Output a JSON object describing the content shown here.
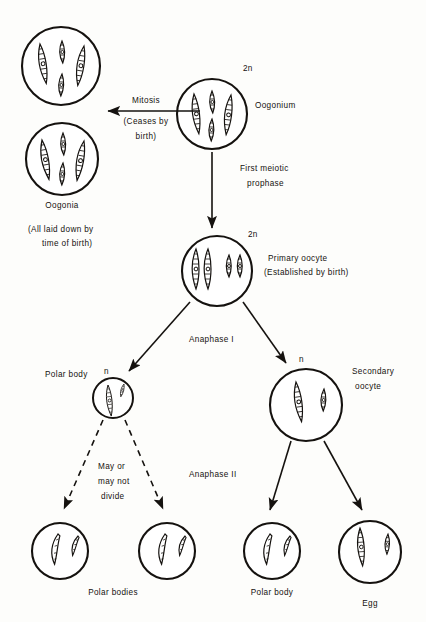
{
  "diagram": {
    "background_color": "#fdfdfb",
    "ink_color": "#15120f",
    "labels": {
      "mitosis": "Mitosis",
      "ceases_by_birth_line1": "(Ceases by",
      "ceases_by_birth_line2": "birth)",
      "oogonia": "Oogonia",
      "all_laid_down_line1": "(All laid down by",
      "all_laid_down_line2": "time of birth)",
      "oogonium": "Oogonium",
      "ploidy_2n_oogonium": "2n",
      "first_meiotic_line1": "First meiotic",
      "first_meiotic_line2": "prophase",
      "ploidy_2n_primary_oocyte": "2n",
      "primary_oocyte_line1": "Primary oocyte",
      "primary_oocyte_line2": "(Established by birth)",
      "anaphase_i": "Anaphase I",
      "polar_body": "Polar body",
      "ploidy_n_polar_body": "n",
      "ploidy_n_secondary_oocyte": "n",
      "secondary_oocyte_line1": "Secondary",
      "secondary_oocyte_line2": "oocyte",
      "may_or_line1": "May or",
      "may_or_line2": "may not",
      "may_or_line3": "divide",
      "anaphase_ii": "Anaphase II",
      "polar_bodies": "Polar bodies",
      "polar_body_bottom": "Polar body",
      "egg": "Egg"
    },
    "cells": [
      {
        "name": "oogonia-upper",
        "cx": 61,
        "cy": 66,
        "r": 39,
        "ploidy": ""
      },
      {
        "name": "oogonia-lower",
        "cx": 62,
        "cy": 159,
        "r": 36,
        "ploidy": ""
      },
      {
        "name": "oogonium",
        "cx": 212,
        "cy": 114,
        "r": 35,
        "ploidy": "2n"
      },
      {
        "name": "primary-oocyte",
        "cx": 217,
        "cy": 271,
        "r": 35,
        "ploidy": "2n"
      },
      {
        "name": "polar-body-first",
        "cx": 113,
        "cy": 398,
        "r": 20,
        "ploidy": "n"
      },
      {
        "name": "secondary-oocyte",
        "cx": 306,
        "cy": 405,
        "r": 36,
        "ploidy": "n"
      },
      {
        "name": "polar-body-bottom-1",
        "cx": 60,
        "cy": 551,
        "r": 28,
        "ploidy": ""
      },
      {
        "name": "polar-body-bottom-2",
        "cx": 167,
        "cy": 551,
        "r": 28,
        "ploidy": ""
      },
      {
        "name": "polar-body-bottom-3",
        "cx": 272,
        "cy": 551,
        "r": 28,
        "ploidy": ""
      },
      {
        "name": "egg",
        "cx": 370,
        "cy": 552,
        "r": 31,
        "ploidy": ""
      }
    ],
    "arrows": [
      {
        "name": "mitosis-arrow",
        "style": "solid",
        "from": [
          200,
          111
        ],
        "to": [
          104,
          111
        ]
      },
      {
        "name": "first-meiotic-prophase-arrow",
        "style": "solid",
        "from": [
          212,
          152
        ],
        "to": [
          212,
          232
        ]
      },
      {
        "name": "anaphase-i-left-arrow",
        "style": "solid",
        "from": [
          190,
          302
        ],
        "to": [
          126,
          374
        ]
      },
      {
        "name": "anaphase-i-right-arrow",
        "style": "solid",
        "from": [
          243,
          302
        ],
        "to": [
          288,
          366
        ]
      },
      {
        "name": "may-divide-left-arrow",
        "style": "dashed",
        "from": [
          103,
          420
        ],
        "to": [
          62,
          513
        ]
      },
      {
        "name": "may-divide-right-arrow",
        "style": "dashed",
        "from": [
          125,
          420
        ],
        "to": [
          165,
          513
        ]
      },
      {
        "name": "anaphase-ii-left-arrow",
        "style": "solid",
        "from": [
          291,
          441
        ],
        "to": [
          268,
          514
        ]
      },
      {
        "name": "anaphase-ii-right-arrow",
        "style": "solid",
        "from": [
          324,
          441
        ],
        "to": [
          364,
          514
        ]
      }
    ]
  }
}
